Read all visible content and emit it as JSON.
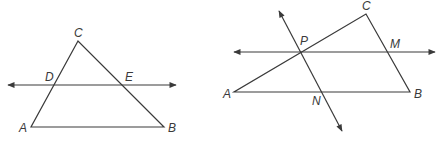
{
  "figures": [
    {
      "id": "left",
      "description": "Triangle ABC with line through D and E parallel to AB",
      "points": {
        "A": {
          "label": "A",
          "x": 31,
          "y": 127,
          "lx": 19,
          "ly": 132
        },
        "B": {
          "label": "B",
          "x": 164,
          "y": 127,
          "lx": 168,
          "ly": 132
        },
        "C": {
          "label": "C",
          "x": 78,
          "y": 41,
          "lx": 74,
          "ly": 37
        },
        "D": {
          "label": "D",
          "x": 54,
          "y": 85,
          "lx": 45,
          "ly": 81
        },
        "E": {
          "label": "E",
          "x": 122,
          "y": 85,
          "lx": 125,
          "ly": 81
        }
      },
      "line": {
        "x1": 8,
        "y1": 85,
        "x2": 176,
        "y2": 85
      }
    },
    {
      "id": "right",
      "description": "Triangle ABC with line PM parallel to AB and line PN parallel to BC",
      "points": {
        "A": {
          "label": "A",
          "x": 234,
          "y": 92,
          "lx": 223,
          "ly": 98
        },
        "B": {
          "label": "B",
          "x": 410,
          "y": 92,
          "lx": 414,
          "ly": 98
        },
        "C": {
          "label": "C",
          "x": 366,
          "y": 14,
          "lx": 362,
          "ly": 10
        },
        "P": {
          "label": "P",
          "x": 300,
          "y": 52,
          "lx": 300,
          "ly": 45
        },
        "M": {
          "label": "M",
          "x": 388,
          "y": 52,
          "lx": 390,
          "ly": 48
        },
        "N": {
          "label": "N",
          "x": 323,
          "y": 92,
          "lx": 312,
          "ly": 105
        }
      },
      "line_pm": {
        "x1": 234,
        "y1": 52,
        "x2": 435,
        "y2": 52
      },
      "line_pn": {
        "x1": 279,
        "y1": 11,
        "x2": 342,
        "y2": 131
      }
    }
  ]
}
